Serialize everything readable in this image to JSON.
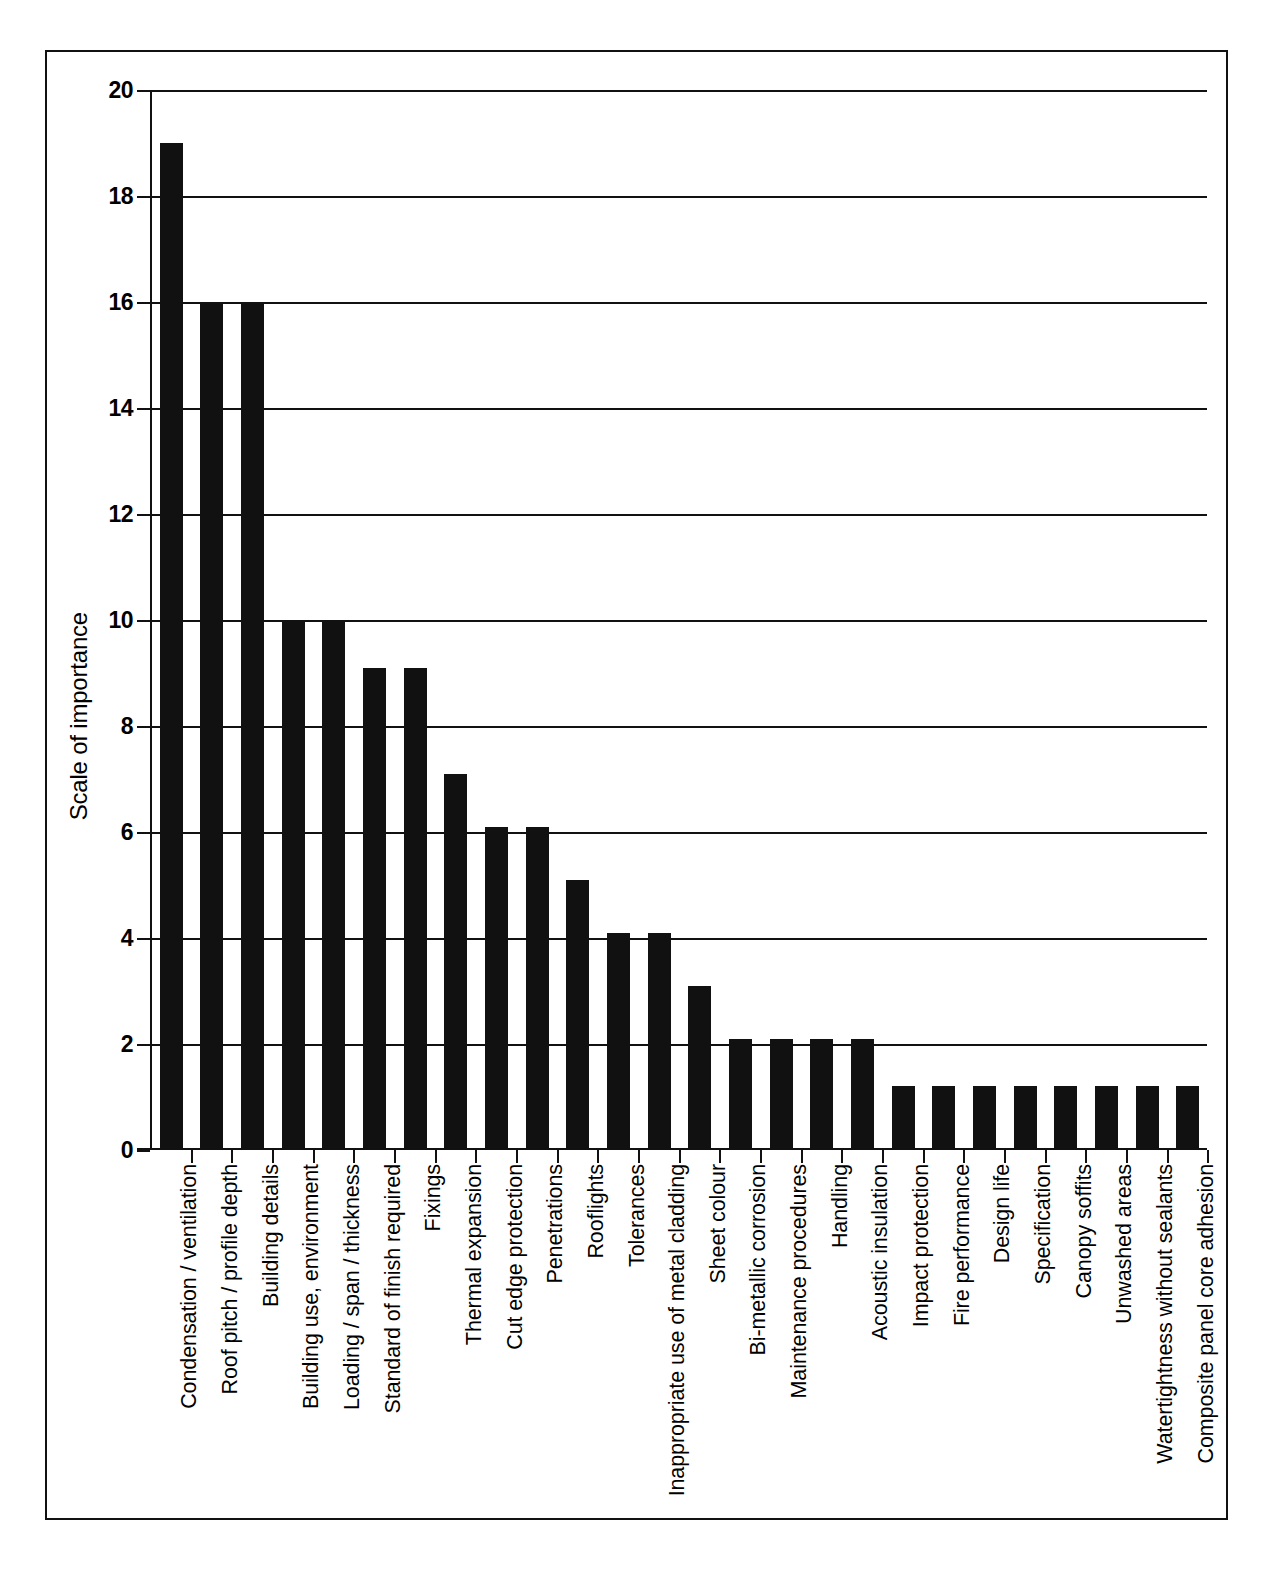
{
  "figure": {
    "background_color": "#ffffff",
    "ink_color": "#111111"
  },
  "chart_data": {
    "type": "bar",
    "title": "",
    "xlabel": "",
    "ylabel": "Scale of importance",
    "ylim": [
      0,
      20
    ],
    "yticks": [
      0,
      2,
      4,
      6,
      8,
      10,
      12,
      14,
      16,
      18,
      20
    ],
    "ytick_labels": [
      "0",
      "2",
      "4",
      "6",
      "8",
      "10",
      "12",
      "14",
      "16",
      "18",
      "20"
    ],
    "grid": "horizontal",
    "legend": "none",
    "bar_color": "#111111",
    "categories": [
      "Condensation / ventilation",
      "Roof pitch / profile depth",
      "Building details",
      "Building use, environment",
      "Loading / span / thickness",
      "Standard of finish required",
      "Fixings",
      "Thermal expansion",
      "Cut edge protection",
      "Penetrations",
      "Rooflights",
      "Tolerances",
      "Inappropriate use of metal cladding",
      "Sheet colour",
      "Bi-metallic corrosion",
      "Maintenance procedures",
      "Handling",
      "Acoustic insulation",
      "Impact protection",
      "Fire performance",
      "Design life",
      "Specification",
      "Canopy soffits",
      "Unwashed areas",
      "Watertightness without sealants",
      "Composite panel core adhesion"
    ],
    "values": [
      19.0,
      16.0,
      16.0,
      10.0,
      10.0,
      9.1,
      9.1,
      7.1,
      6.1,
      6.1,
      5.1,
      4.1,
      4.1,
      3.1,
      2.1,
      2.1,
      2.1,
      2.1,
      1.2,
      1.2,
      1.2,
      1.2,
      1.2,
      1.2,
      1.2,
      1.2
    ]
  }
}
